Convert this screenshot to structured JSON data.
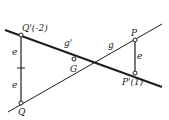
{
  "diagram": {
    "colors": {
      "ink": "#1e1e1e",
      "background": "#ffffff"
    },
    "lines": {
      "g_prime": {
        "label": "g'"
      },
      "g": {
        "label": "g"
      }
    },
    "points": {
      "Q_prime": {
        "label": "Q'(-2)"
      },
      "Q": {
        "label": "Q"
      },
      "G": {
        "label": "G"
      },
      "P": {
        "label": "P"
      },
      "P_prime": {
        "label": "P'(1)"
      }
    },
    "segments": {
      "e_left_upper": {
        "label": "e"
      },
      "e_left_lower": {
        "label": "e"
      },
      "e_right": {
        "label": "e"
      }
    }
  }
}
